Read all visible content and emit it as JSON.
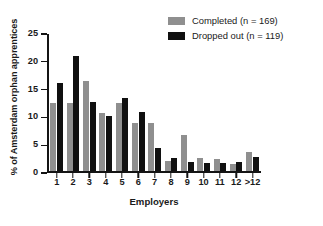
{
  "chart_data": {
    "type": "bar",
    "title": "",
    "subtitle": "",
    "xlabel": "Employers",
    "ylabel": "% of Amsterdam orphan apprentices",
    "categories": [
      "1",
      "2",
      "3",
      "4",
      "5",
      "6",
      "7",
      "8",
      "9",
      "10",
      "11",
      "12",
      ">12"
    ],
    "series": [
      {
        "name": "Completed (n = 169)",
        "color": "#8f8f8f",
        "values": [
          12.5,
          12.5,
          16.5,
          10.6,
          12.5,
          8.9,
          8.9,
          1.9,
          6.6,
          2.4,
          2.3,
          1.3,
          3.5
        ]
      },
      {
        "name": "Dropped out (n = 119)",
        "color": "#101010",
        "values": [
          16.0,
          21.0,
          12.6,
          10.0,
          13.4,
          10.9,
          4.2,
          2.5,
          1.7,
          1.6,
          1.6,
          1.7,
          2.6
        ]
      }
    ],
    "ylim": [
      0,
      25
    ],
    "yticks": [
      0,
      5,
      10,
      15,
      20,
      25
    ],
    "ytick_labels": [
      "0",
      "5",
      "10",
      "15",
      "20",
      "25"
    ],
    "grid": false,
    "legend_position": "top-right",
    "legend": [
      {
        "label": "Completed (n = 169)",
        "swatch": "#8f8f8f"
      },
      {
        "label": "Dropped out (n = 119)",
        "swatch": "#101010"
      }
    ]
  }
}
